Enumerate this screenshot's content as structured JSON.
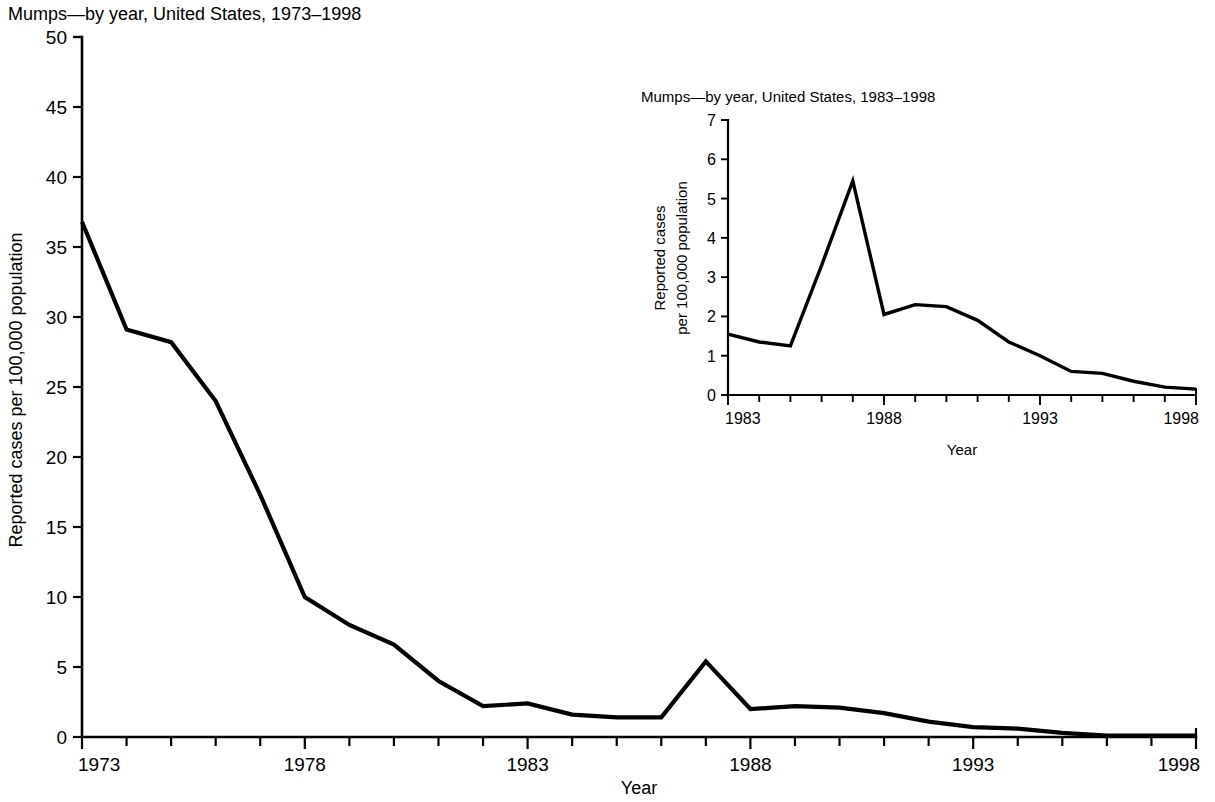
{
  "figure": {
    "background_color": "#ffffff",
    "line_color": "#000000"
  },
  "main": {
    "title": "Mumps—by year, United States, 1973–1998",
    "xlabel": "Year",
    "ylabel": "Reported cases per 100,000 population",
    "y_ticks": [
      "0",
      "5",
      "10",
      "15",
      "20",
      "25",
      "30",
      "35",
      "40",
      "45",
      "50"
    ],
    "x_ticks": [
      "1973",
      "1978",
      "1983",
      "1988",
      "1993",
      "1998"
    ]
  },
  "inset": {
    "title": "Mumps—by year, United States, 1983–1998",
    "xlabel": "Year",
    "ylabel_line1": "Reported cases",
    "ylabel_line2": "per 100,000 population",
    "y_ticks": [
      "0",
      "1",
      "2",
      "3",
      "4",
      "5",
      "6",
      "7"
    ],
    "x_ticks": [
      "1983",
      "1988",
      "1993",
      "1998"
    ]
  },
  "chart_data": [
    {
      "type": "line",
      "id": "main-chart",
      "title": "Mumps—by year, United States, 1973–1998",
      "xlabel": "Year",
      "ylabel": "Reported cases per 100,000 population",
      "xlim": [
        1973,
        1998
      ],
      "ylim": [
        0,
        50
      ],
      "ytick_step": 5,
      "xtick_step": 1,
      "xtick_label_step": 5,
      "grid": false,
      "legend": false,
      "x": [
        1973,
        1974,
        1975,
        1976,
        1977,
        1978,
        1979,
        1980,
        1981,
        1982,
        1983,
        1984,
        1985,
        1986,
        1987,
        1988,
        1989,
        1990,
        1991,
        1992,
        1993,
        1994,
        1995,
        1996,
        1997,
        1998
      ],
      "values": [
        36.8,
        29.1,
        28.2,
        24.0,
        17.3,
        10.0,
        8.0,
        6.6,
        4.0,
        2.2,
        2.4,
        1.6,
        1.4,
        1.4,
        5.4,
        2.0,
        2.2,
        2.1,
        1.7,
        1.1,
        0.7,
        0.6,
        0.3,
        0.1,
        0.1,
        0.1
      ]
    },
    {
      "type": "line",
      "id": "inset-chart",
      "title": "Mumps—by year, United States, 1983–1998",
      "xlabel": "Year",
      "ylabel": "Reported cases per 100,000 population",
      "xlim": [
        1983,
        1998
      ],
      "ylim": [
        0,
        7
      ],
      "ytick_step": 1,
      "xtick_step": 1,
      "xtick_label_step": 5,
      "grid": false,
      "legend": false,
      "x": [
        1983,
        1984,
        1985,
        1986,
        1987,
        1988,
        1989,
        1990,
        1991,
        1992,
        1993,
        1994,
        1995,
        1996,
        1997,
        1998
      ],
      "values": [
        1.55,
        1.35,
        1.25,
        3.3,
        5.45,
        2.05,
        2.3,
        2.25,
        1.9,
        1.35,
        1.0,
        0.6,
        0.55,
        0.35,
        0.2,
        0.15
      ]
    }
  ],
  "geometry": {
    "main": {
      "x0": 82,
      "x1": 1196,
      "y0": 737,
      "y1": 37,
      "title_x": 8,
      "title_y": 20,
      "ylabel_x": 22,
      "ylabel_y": 390,
      "xlabel_x": 639,
      "xlabel_y": 794,
      "tick_len": 9,
      "ytick_len": 9
    },
    "inset": {
      "x0": 728,
      "x1": 1196,
      "y0": 395,
      "y1": 120,
      "title_x": 641,
      "title_y": 102,
      "ylabel_x1": 665,
      "ylabel_x2": 687,
      "ylabel_y": 258,
      "xlabel_x": 962,
      "xlabel_y": 455,
      "tick_len": 7,
      "ytick_len": 7
    }
  }
}
